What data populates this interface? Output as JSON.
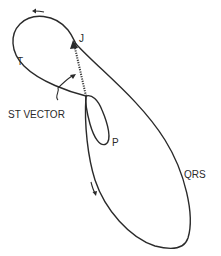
{
  "diagram": {
    "type": "vectorcardiogram-loop",
    "labels": {
      "j_point": "J",
      "t_loop": "T",
      "st_vector": "ST VECTOR",
      "p_loop": "P",
      "qrs_loop": "QRS"
    },
    "colors": {
      "stroke": "#2a2a2a",
      "background": "#ffffff"
    }
  }
}
